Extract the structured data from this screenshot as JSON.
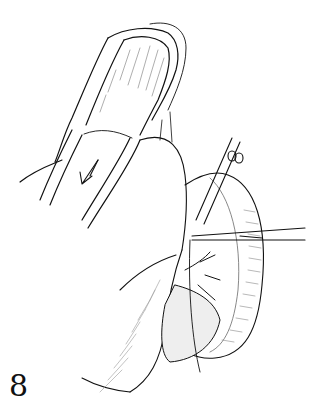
{
  "figure": {
    "number": "8",
    "type": "surgical line illustration",
    "elements": [
      "bowel-loop",
      "direction-arrow",
      "forceps-upper",
      "forceps-lower",
      "mesentery-vessels",
      "stippled-tissue",
      "suture-thread"
    ]
  },
  "colors": {
    "ink": "#111111",
    "background": "#ffffff"
  }
}
